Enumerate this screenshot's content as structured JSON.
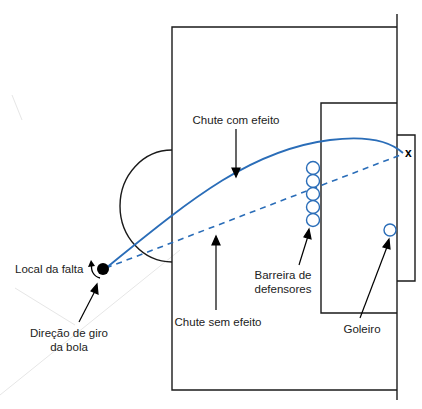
{
  "diagram": {
    "colors": {
      "field_lines": "#1a1a1a",
      "trajectory": "#2a6db8",
      "ball": "#000000",
      "faint_lines": "#e4e4e4"
    },
    "labels": {
      "curved_shot": "Chute com efeito",
      "straight_shot": "Chute sem efeito",
      "foul_location": "Local da falta",
      "spin_direction_line1": "Direção de giro",
      "spin_direction_line2": "da bola",
      "wall_line1": "Barreira de",
      "wall_line2": "defensores",
      "goalkeeper": "Goleiro",
      "target_mark": "x"
    },
    "elements": {
      "defender_wall_count": 5,
      "goalkeeper_count": 1
    }
  }
}
